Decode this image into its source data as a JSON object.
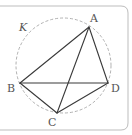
{
  "diagram": {
    "title": "",
    "circle": {
      "name": "K",
      "style": "dashed"
    },
    "points": [
      {
        "id": "A",
        "label": "A"
      },
      {
        "id": "B",
        "label": "B"
      },
      {
        "id": "C",
        "label": "C"
      },
      {
        "id": "D",
        "label": "D"
      }
    ],
    "segments": [
      {
        "from": "A",
        "to": "B"
      },
      {
        "from": "A",
        "to": "C"
      },
      {
        "from": "A",
        "to": "D"
      },
      {
        "from": "B",
        "to": "D"
      },
      {
        "from": "B",
        "to": "C"
      },
      {
        "from": "C",
        "to": "D"
      }
    ],
    "colors": {
      "line": "#3a3a3a",
      "circle": "#a8a8a8",
      "frame": "#bdbdbd",
      "text": "#555555"
    }
  }
}
